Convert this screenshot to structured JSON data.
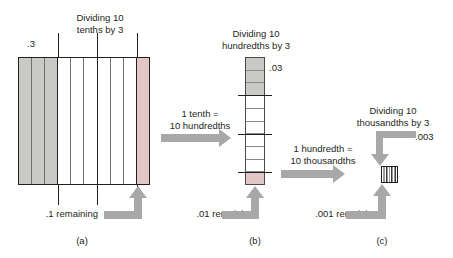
{
  "figure": {
    "caption_a": "(a)",
    "caption_b": "(b)",
    "caption_c": "(c)"
  },
  "panel_a": {
    "title": "Dividing 10\ntenths by 3",
    "quotient_label": ".3",
    "remainder_label": ".1 remaining",
    "total_units": 10,
    "shaded_units": 3,
    "remaining_units": 1,
    "group_size": 3
  },
  "panel_b": {
    "title": "Dividing 10\nhundredths by 3",
    "quotient_label": ".03",
    "remainder_label": ".01 remaining",
    "total_units": 10,
    "shaded_units": 3,
    "remaining_units": 1,
    "group_size": 3
  },
  "panel_c": {
    "title": "Dividing 10\nthousandths by 3",
    "quotient_label": ".003",
    "remainder_label": ".001 remaining",
    "total_units": 10,
    "group_size": 3
  },
  "transitions": {
    "a_to_b": "1 tenth =\n10 hundredths",
    "b_to_c": "1 hundredth =\n10 thousandths"
  },
  "colors": {
    "shaded": "#c9cac6",
    "remainder": "#e2c6c6",
    "outline": "#231f20",
    "arrow": "#a8a8a8",
    "text": "#231f20",
    "background": "#ffffff"
  }
}
